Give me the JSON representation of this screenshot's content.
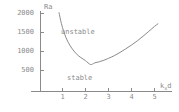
{
  "chart_data": {
    "type": "line",
    "title": "",
    "xlabel": "kₓd",
    "xlabel_base": "k",
    "xlabel_sub": "x",
    "xlabel_tail": "d",
    "ylabel": "Ra",
    "xlim": [
      0,
      5.4
    ],
    "ylim": [
      0,
      2100
    ],
    "grid": false,
    "legend": null,
    "xticks": [
      1,
      2,
      3,
      4,
      5
    ],
    "xtick_labels": [
      "1",
      "2",
      "3",
      "4",
      "5"
    ],
    "yticks": [
      500,
      1000,
      1500,
      2000
    ],
    "ytick_labels": [
      "500",
      "1000",
      "1500",
      "2000"
    ],
    "series": [
      {
        "name": "marginal stability curve",
        "color": "#8a8a8a",
        "x": [
          0.85,
          0.95,
          1.05,
          1.15,
          1.25,
          1.4,
          1.6,
          1.8,
          2.0,
          2.22,
          2.4,
          2.6,
          2.8,
          3.0,
          3.25,
          3.5,
          3.75,
          4.0,
          4.25,
          4.5,
          4.75,
          5.0,
          5.15
        ],
        "y": [
          2020,
          1740,
          1530,
          1370,
          1240,
          1090,
          940,
          840,
          760,
          657,
          700,
          730,
          770,
          820,
          890,
          975,
          1070,
          1170,
          1280,
          1400,
          1530,
          1660,
          1730
        ]
      }
    ],
    "annotations": [
      {
        "text": "unstable",
        "x": 1.95,
        "y": 1500
      },
      {
        "text": "stable",
        "x": 2.2,
        "y": 300
      }
    ],
    "minimum": {
      "x": 2.22,
      "y": 657
    },
    "axis_color": "#8a8a8a",
    "curve_color": "#8a8a8a",
    "background": "#ffffff"
  }
}
